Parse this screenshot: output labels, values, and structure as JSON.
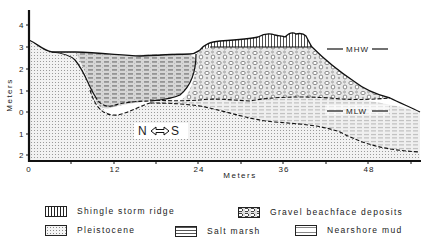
{
  "figure": {
    "type": "geologic-cross-section",
    "direction_label": {
      "left": "N",
      "right": "S",
      "icon": "double-arrow-icon"
    },
    "x_axis": {
      "title": "Meters",
      "ticks": [
        "0",
        "12",
        "24",
        "36",
        "48"
      ]
    },
    "y_axis": {
      "title": "Meters",
      "ticks": [
        "4",
        "3",
        "2",
        "1",
        "0",
        "1",
        "2"
      ]
    },
    "annotations": {
      "mhw": "MHW",
      "mlw": "MLW"
    }
  },
  "legend": {
    "items": [
      {
        "key": "shingle",
        "label": "Shingle storm ridge"
      },
      {
        "key": "gravel",
        "label": "Gravel beachface deposits"
      },
      {
        "key": "pleistocene",
        "label": "Pleistocene"
      },
      {
        "key": "saltmarsh",
        "label": "Salt marsh"
      },
      {
        "key": "mud",
        "label": "Nearshore mud"
      }
    ]
  }
}
